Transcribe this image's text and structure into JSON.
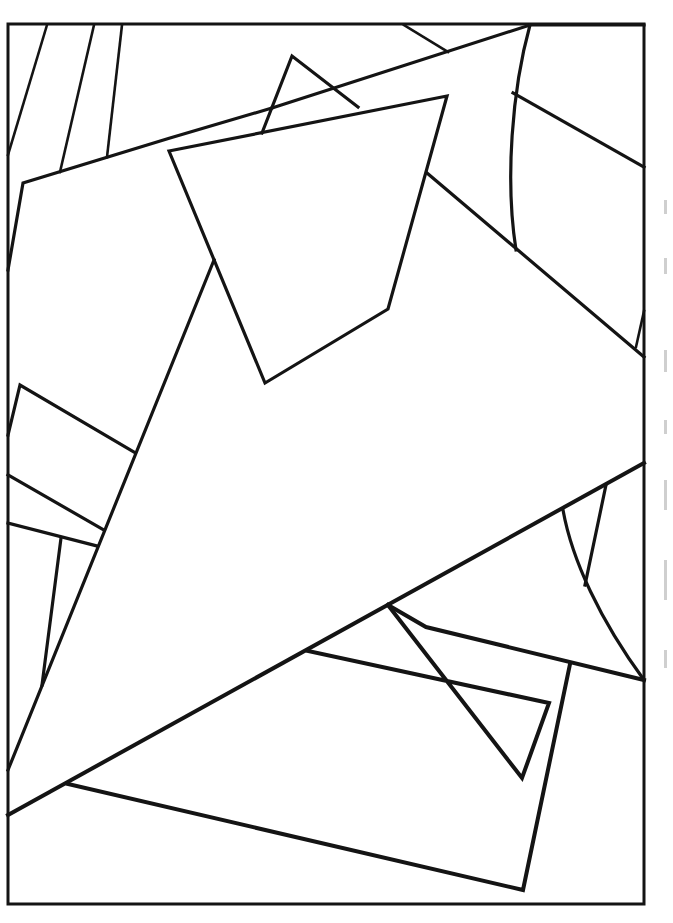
{
  "page": {
    "type": "line-art coloring page",
    "background_color": "#ffffff",
    "line_color": "#141414"
  },
  "frame": {
    "x": 8,
    "y": 24,
    "width": 636,
    "height": 880
  },
  "shapes": [
    {
      "name": "frame-border",
      "kind": "rect",
      "points": "8,24 644,24 644,904 8,904 8,24"
    },
    {
      "name": "left-stripe-1",
      "kind": "line",
      "points": "47,25 8,155"
    },
    {
      "name": "left-stripe-2",
      "kind": "line",
      "points": "94,25 60,172"
    },
    {
      "name": "left-stripe-3",
      "kind": "line",
      "points": "122,25 107,157"
    },
    {
      "name": "large-quad-top-edge",
      "kind": "polyline",
      "points": "8,270 23,183 170,138 272,108"
    },
    {
      "name": "large-quad-to-corner",
      "kind": "polyline",
      "points": "272,108 530,25 644,25"
    },
    {
      "name": "small-tri",
      "kind": "polyline",
      "points": "262,133 292,56 358,107"
    },
    {
      "name": "top-diagonal",
      "kind": "line",
      "points": "404,25 448,52"
    },
    {
      "name": "inner-kite",
      "kind": "polygon",
      "points": "169,151 447,96 388,309 265,383"
    },
    {
      "name": "right-curve",
      "kind": "path",
      "d": "M530,25 C512,90 505,180 516,250"
    },
    {
      "name": "right-diagonal",
      "kind": "line",
      "points": "513,93 644,167"
    },
    {
      "name": "big-triangle-upper-edge",
      "kind": "polyline",
      "points": "427,173 644,357"
    },
    {
      "name": "big-triangle-left-edge",
      "kind": "polyline",
      "points": "214,260 8,770"
    },
    {
      "name": "corner-sliver",
      "kind": "line",
      "points": "636,347 644,311"
    },
    {
      "name": "big-triangle-lower-edge",
      "kind": "line",
      "points": "8,815 644,463"
    },
    {
      "name": "left-rect-upper",
      "kind": "polyline",
      "points": "8,435 20,385 134,452"
    },
    {
      "name": "left-rect-mid",
      "kind": "line",
      "points": "8,475 104,530"
    },
    {
      "name": "left-rect-low",
      "kind": "line",
      "points": "8,523 97,546"
    },
    {
      "name": "left-short-vertical",
      "kind": "line",
      "points": "61,538 42,685"
    },
    {
      "name": "right-lower-curve",
      "kind": "path",
      "d": "M563,510 C572,560 600,620 644,680"
    },
    {
      "name": "right-lower-slant",
      "kind": "line",
      "points": "606,485 585,585"
    },
    {
      "name": "lower-wedge-top",
      "kind": "polyline",
      "points": "388,605 426,627 644,680"
    },
    {
      "name": "inner-rect",
      "kind": "polyline",
      "points": "308,651 549,703 522,778 388,605"
    },
    {
      "name": "outer-rect",
      "kind": "polyline",
      "points": "68,784 523,890 570,664"
    }
  ],
  "margin_text": {
    "legible": false
  }
}
